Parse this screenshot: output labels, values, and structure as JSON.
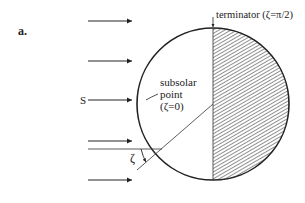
{
  "figure": {
    "panel_label": "a.",
    "source_label": "S",
    "terminator_label": "terminator (ζ=π/2)",
    "subsolar_label_line1": "subsolar",
    "subsolar_label_line2": "point",
    "subsolar_label_line3": "(ζ=0)",
    "angle_label": "ζ",
    "colors": {
      "stroke": "#222222",
      "background": "#ffffff",
      "hatch": "#333333"
    }
  }
}
